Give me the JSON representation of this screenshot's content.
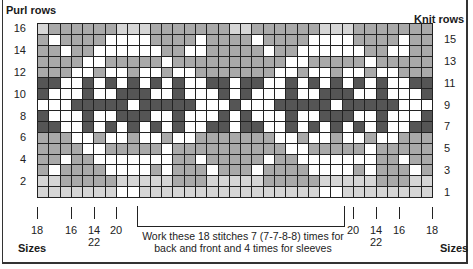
{
  "headers": {
    "left": "Purl rows",
    "right": "Knit rows"
  },
  "row_labels": {
    "left": [
      "16",
      "14",
      "12",
      "10",
      "8",
      "6",
      "4",
      "2"
    ],
    "right": [
      "15",
      "13",
      "11",
      "9",
      "7",
      "5",
      "3",
      "1"
    ]
  },
  "colors": {
    "W": "#ffffff",
    "L": "#d6d6d6",
    "M": "#a9a9a9",
    "D": "#555555"
  },
  "legend_note": "W=white, L=light gray, M=medium gray, D=dark gray",
  "grid": {
    "columns": 35,
    "rows": 16,
    "repeat_width": 18,
    "repeat_rows_top_to_bottom": [
      "LMMMMMMLLLMMMMMMML",
      "MWMMMMWWWWMMMMWMMM",
      "MMWMMWWWWWWMMWWMMM",
      "MMMMWWMMMMMWMMMMMM",
      "MMMWWMWWMWWMWWMMMM",
      "DDWWDWDWDWDWDWWDDW",
      "DWWWDWWDDDWWDWWWDW",
      "WWWDDDDDWDDDDDWWWD",
      "DWWWDWWDDDWWDWWWDW",
      "DDWWDWDWDWDWDWWDDW",
      "MMMWWMWWMWWMWWMMMM",
      "MMMMWWMMMMMWMMMMMM",
      "MMWMMWWWWWWWMMWMMM",
      "MWMMMMWWWWMWMMMWMM",
      "LLMMMMMLLLLLMMMLLL",
      "LLLLLLLWWLLLLLLLLL"
    ]
  },
  "sizes": {
    "label": "Sizes",
    "left_ticks": [
      {
        "label": "18",
        "x": 37
      },
      {
        "label": "16",
        "x": 71
      },
      {
        "label": "14\n22",
        "x": 94
      },
      {
        "label": "20",
        "x": 116
      }
    ],
    "right_ticks": [
      {
        "label": "20",
        "x": 353
      },
      {
        "label": "14\n22",
        "x": 376
      },
      {
        "label": "16",
        "x": 399
      },
      {
        "label": "18",
        "x": 432
      }
    ]
  },
  "note": {
    "line1": "Work these 18 stitches 7 (7-7-8-8) times for",
    "line2": "back and front and 4 times for sleeves"
  }
}
